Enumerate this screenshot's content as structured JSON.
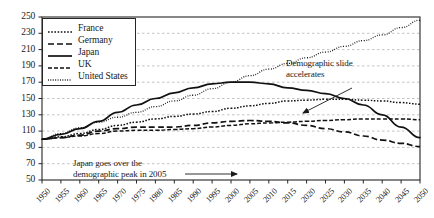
{
  "chart_data": {
    "type": "line",
    "title": "",
    "subtitle": "",
    "xlabel": "",
    "ylabel": "",
    "xlim": [
      1950,
      2050
    ],
    "ylim": [
      50,
      250
    ],
    "ytick_step": 20,
    "xtick_step": 5,
    "grid": true,
    "grid_axis": "y",
    "legend_position": "top-left",
    "x": [
      1950,
      1955,
      1960,
      1965,
      1970,
      1975,
      1980,
      1985,
      1990,
      1995,
      2000,
      2005,
      2010,
      2015,
      2020,
      2025,
      2030,
      2035,
      2040,
      2045,
      2050
    ],
    "categories": [
      "1950",
      "1955",
      "1960",
      "1965",
      "1970",
      "1975",
      "1980",
      "1985",
      "1990",
      "1995",
      "2000",
      "2005",
      "2010",
      "2015",
      "2020",
      "2025",
      "2030",
      "2035",
      "2040",
      "2045",
      "2050"
    ],
    "ticks_y": [
      50,
      70,
      90,
      110,
      130,
      150,
      170,
      190,
      210,
      230,
      250
    ],
    "series": [
      {
        "name": "France",
        "style": "dotted",
        "values": [
          100,
          103,
          107,
          112,
          117,
          121,
          125,
          128,
          131,
          134,
          138,
          141,
          144,
          147,
          148,
          149,
          149,
          148,
          147,
          145,
          143
        ]
      },
      {
        "name": "Germany",
        "style": "dashed",
        "values": [
          100,
          102,
          105,
          110,
          113,
          115,
          115,
          115,
          117,
          120,
          122,
          123,
          122,
          120,
          117,
          113,
          109,
          104,
          99,
          95,
          91
        ]
      },
      {
        "name": "Japan",
        "style": "solid",
        "values": [
          100,
          106,
          113,
          122,
          133,
          142,
          150,
          157,
          163,
          168,
          170,
          170,
          168,
          163,
          160,
          156,
          150,
          142,
          130,
          115,
          102
        ]
      },
      {
        "name": "UK",
        "style": "dashdot",
        "values": [
          100,
          102,
          104,
          107,
          110,
          111,
          111,
          112,
          113,
          115,
          117,
          119,
          120,
          121,
          122,
          123,
          124,
          125,
          125,
          125,
          124
        ]
      },
      {
        "name": "United States",
        "style": "finedotted",
        "values": [
          100,
          107,
          114,
          121,
          127,
          133,
          140,
          147,
          154,
          162,
          170,
          178,
          186,
          193,
          200,
          207,
          214,
          221,
          228,
          237,
          246
        ]
      }
    ],
    "annotations": [
      {
        "id": "demographic-slide",
        "line1": "Demographic slide",
        "line2": "accelerates",
        "arrow_from": [
          352,
          88
        ],
        "arrow_to": [
          303,
          113
        ]
      },
      {
        "id": "japan-peak",
        "line1": "Japan goes over the",
        "line2": "demographic peak in 2005",
        "arrow_from": [
          185,
          174
        ],
        "arrow_to": [
          237,
          174
        ]
      }
    ]
  }
}
